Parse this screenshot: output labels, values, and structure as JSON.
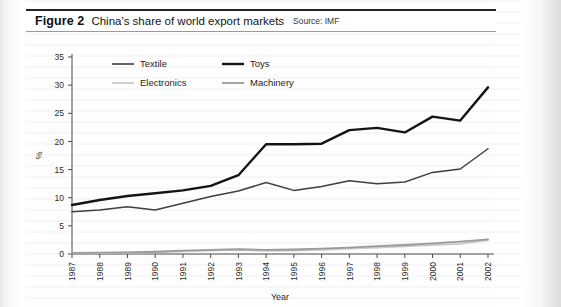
{
  "figure": {
    "number": "Figure 2",
    "title": "China's share of world export markets",
    "source": "Source: IMF"
  },
  "axis": {
    "ylabel": "%",
    "xlabel": "Year"
  },
  "legend": {
    "items": [
      {
        "label": "Textile",
        "color": "#3f3f3f"
      },
      {
        "label": "Toys",
        "color": "#141414"
      },
      {
        "label": "Electronics",
        "color": "#c9c9c9"
      },
      {
        "label": "Machinery",
        "color": "#9a9a9a"
      }
    ]
  },
  "chart_data": {
    "type": "line",
    "title": "China's share of world export markets",
    "xlabel": "Year",
    "ylabel": "%",
    "ylim": [
      0,
      35
    ],
    "yticks": [
      0,
      5,
      10,
      15,
      20,
      25,
      30,
      35
    ],
    "grid": false,
    "legend_position": "top-left-inside",
    "categories": [
      "1987",
      "1988",
      "1989",
      "1990",
      "1991",
      "1992",
      "1993",
      "1994",
      "1995",
      "1996",
      "1997",
      "1998",
      "1999",
      "2000",
      "2001",
      "2002"
    ],
    "series": [
      {
        "name": "Textile",
        "color": "#3f3f3f",
        "width": 1.5,
        "values": [
          7.5,
          7.8,
          8.4,
          7.8,
          9.0,
          10.2,
          11.2,
          12.7,
          11.3,
          12.0,
          13.0,
          12.5,
          12.8,
          14.5,
          15.1,
          18.7
        ]
      },
      {
        "name": "Toys",
        "color": "#141414",
        "width": 2.4,
        "values": [
          8.7,
          9.6,
          10.3,
          10.8,
          11.3,
          12.1,
          14.0,
          19.5,
          19.5,
          19.6,
          22.0,
          22.4,
          21.6,
          24.4,
          23.7,
          29.6
        ]
      },
      {
        "name": "Electronics",
        "color": "#c9c9c9",
        "width": 1.8,
        "values": [
          0.15,
          0.2,
          0.25,
          0.3,
          0.45,
          0.6,
          0.7,
          0.55,
          0.6,
          0.75,
          0.95,
          1.15,
          1.35,
          1.6,
          1.8,
          2.45
        ]
      },
      {
        "name": "Machinery",
        "color": "#9a9a9a",
        "width": 1.8,
        "values": [
          0.2,
          0.25,
          0.3,
          0.4,
          0.6,
          0.75,
          0.85,
          0.75,
          0.8,
          0.95,
          1.15,
          1.4,
          1.6,
          1.9,
          2.2,
          2.6
        ]
      }
    ]
  }
}
